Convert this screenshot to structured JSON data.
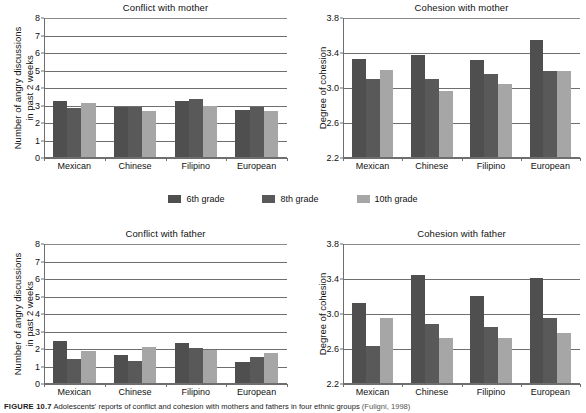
{
  "figure": {
    "caption_number": "FIGURE 10.7",
    "caption_text": "Adolescents' reports of conflict and cohesion with mothers and fathers in four ethnic groups",
    "caption_source": "(Fuligni, 1998)"
  },
  "legend": {
    "position": "center",
    "items": [
      {
        "label": "6th grade",
        "color": "#4f4f4f"
      },
      {
        "label": "8th grade",
        "color": "#595959"
      },
      {
        "label": "10th grade",
        "color": "#a6a6a6"
      }
    ]
  },
  "colors": {
    "grade6": "#4f4f4f",
    "grade8": "#595959",
    "grade10": "#a6a6a6",
    "axis": "#6e6e6e",
    "text": "#111111"
  },
  "chart_data": [
    {
      "id": "conflict-mother",
      "type": "bar",
      "title": "Conflict with mother",
      "xlabel": "",
      "ylabel": "Number of angry discussions in past 2 weeks",
      "ylabel_line1": "Number of angry discussions",
      "ylabel_line2": "in past 2 weeks",
      "categories": [
        "Mexican",
        "Chinese",
        "Filipino",
        "European"
      ],
      "yticks": [
        0,
        1,
        2,
        3,
        4,
        5,
        6,
        7,
        8
      ],
      "ylim": [
        0,
        8
      ],
      "grid": true,
      "series": [
        {
          "name": "6th grade",
          "values": [
            3.25,
            2.9,
            3.25,
            2.75
          ]
        },
        {
          "name": "8th grade",
          "values": [
            2.85,
            2.9,
            3.35,
            2.9
          ]
        },
        {
          "name": "10th grade",
          "values": [
            3.15,
            2.7,
            3.0,
            2.7
          ]
        }
      ]
    },
    {
      "id": "cohesion-mother",
      "type": "bar",
      "title": "Cohesion with mother",
      "xlabel": "",
      "ylabel": "Degree of cohesion",
      "categories": [
        "Mexican",
        "Chinese",
        "Filipino",
        "European"
      ],
      "yticks": [
        2.2,
        2.6,
        3.0,
        3.4,
        3.8
      ],
      "ylim": [
        2.2,
        3.8
      ],
      "grid": true,
      "series": [
        {
          "name": "6th grade",
          "values": [
            3.33,
            3.38,
            3.32,
            3.55
          ]
        },
        {
          "name": "8th grade",
          "values": [
            3.1,
            3.1,
            3.16,
            3.19
          ]
        },
        {
          "name": "10th grade",
          "values": [
            3.21,
            2.97,
            3.05,
            3.19
          ]
        }
      ]
    },
    {
      "id": "conflict-father",
      "type": "bar",
      "title": "Conflict with father",
      "xlabel": "",
      "ylabel": "Number of angry discussions in past 2 weeks",
      "ylabel_line1": "Number of angry discussions",
      "ylabel_line2": "in past 2 weeks",
      "categories": [
        "Mexican",
        "Chinese",
        "Filipino",
        "European"
      ],
      "yticks": [
        0,
        1,
        2,
        3,
        4,
        5,
        6,
        7,
        8
      ],
      "ylim": [
        0,
        8
      ],
      "grid": true,
      "series": [
        {
          "name": "6th grade",
          "values": [
            2.45,
            1.65,
            2.35,
            1.25
          ]
        },
        {
          "name": "8th grade",
          "values": [
            1.42,
            1.3,
            2.05,
            1.55
          ]
        },
        {
          "name": "10th grade",
          "values": [
            1.9,
            2.1,
            1.95,
            1.75
          ]
        }
      ]
    },
    {
      "id": "cohesion-father",
      "type": "bar",
      "title": "Cohesion with father",
      "xlabel": "",
      "ylabel": "Degree of cohesion",
      "categories": [
        "Mexican",
        "Chinese",
        "Filipino",
        "European"
      ],
      "yticks": [
        2.2,
        2.6,
        3.0,
        3.4,
        3.8
      ],
      "ylim": [
        2.2,
        3.8
      ],
      "grid": true,
      "series": [
        {
          "name": "6th grade",
          "values": [
            3.13,
            3.45,
            3.21,
            3.41
          ]
        },
        {
          "name": "8th grade",
          "values": [
            2.64,
            2.89,
            2.85,
            2.96
          ]
        },
        {
          "name": "10th grade",
          "values": [
            2.95,
            2.73,
            2.73,
            2.78
          ]
        }
      ]
    }
  ],
  "layout": {
    "panels": [
      {
        "id": "conflict-mother",
        "left": 0,
        "top": 2,
        "plot_left": 44,
        "plot_top": 16,
        "plot_width": 243,
        "plot_height": 140
      },
      {
        "id": "cohesion-mother",
        "left": 293,
        "top": 2,
        "plot_left": 50,
        "plot_top": 16,
        "plot_width": 237,
        "plot_height": 140
      },
      {
        "id": "conflict-father",
        "left": 0,
        "top": 228,
        "plot_left": 44,
        "plot_top": 16,
        "plot_width": 243,
        "plot_height": 140
      },
      {
        "id": "cohesion-father",
        "left": 293,
        "top": 228,
        "plot_left": 50,
        "plot_top": 16,
        "plot_width": 237,
        "plot_height": 140
      }
    ]
  }
}
